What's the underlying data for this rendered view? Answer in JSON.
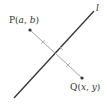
{
  "diagram": {
    "line_label": "l",
    "point_p": {
      "name": "P",
      "open": "(",
      "a": "a",
      "sep": ", ",
      "b": "b",
      "close": ")"
    },
    "point_q": {
      "name": "Q",
      "open": "(",
      "x": "x",
      "sep": ", ",
      "y": "y",
      "close": ")"
    },
    "colors": {
      "line": "#333333",
      "segment": "#888888",
      "point": "#333333"
    }
  }
}
